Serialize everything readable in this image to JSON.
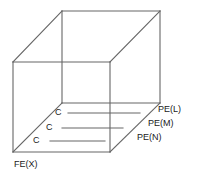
{
  "diagram": {
    "type": "wireframe-cube-3d",
    "title": "",
    "stroke_color": "#666666",
    "text_color": "#1a1a1a",
    "background_color": "#ffffff",
    "canvas": {
      "width": 197,
      "height": 187
    },
    "cube": {
      "front_face": [
        [
          13,
          62
        ],
        [
          110,
          62
        ],
        [
          110,
          152
        ],
        [
          13,
          152
        ]
      ],
      "back_face": [
        [
          62,
          11
        ],
        [
          160,
          11
        ],
        [
          160,
          103
        ],
        [
          62,
          103
        ]
      ],
      "connectors": [
        [
          [
            13,
            62
          ],
          [
            62,
            11
          ]
        ],
        [
          [
            110,
            62
          ],
          [
            160,
            11
          ]
        ],
        [
          [
            110,
            152
          ],
          [
            160,
            103
          ]
        ],
        [
          [
            13,
            152
          ],
          [
            62,
            103
          ]
        ]
      ]
    },
    "c_lines": [
      {
        "label": "C",
        "y": 113,
        "x_start": 68,
        "x_end": 140,
        "label_x": 55,
        "label_y": 108
      },
      {
        "label": "C",
        "y": 128,
        "x_start": 62,
        "x_end": 123,
        "label_x": 46,
        "label_y": 123
      },
      {
        "label": "C",
        "y": 141,
        "x_start": 50,
        "x_end": 105,
        "label_x": 33,
        "label_y": 136
      }
    ],
    "pe_labels": [
      {
        "text": "PE(L)",
        "x": 158,
        "y": 105
      },
      {
        "text": "PE(M)",
        "x": 148,
        "y": 119
      },
      {
        "text": "PE(N)",
        "x": 137,
        "y": 133
      }
    ],
    "fe_label": {
      "text": "FE(X)",
      "x": 14,
      "y": 160
    }
  }
}
